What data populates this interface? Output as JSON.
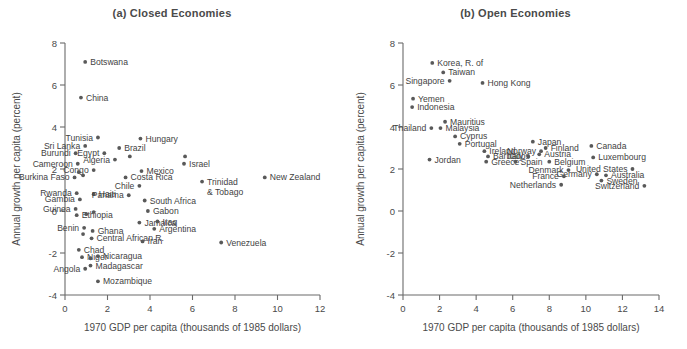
{
  "figure": {
    "width": 687,
    "height": 349,
    "background": "#ffffff",
    "dot_color": "#595959",
    "axis_color": "#6b6b6b",
    "text_color": "#3f3f3f"
  },
  "chart_data": [
    {
      "type": "scatter",
      "panel": "a",
      "title": "(a) Closed Economies",
      "xlabel": "1970 GDP per capita (thousands of 1985 dollars)",
      "ylabel": "Annual growth per capita (percent)",
      "xlim": [
        0,
        12
      ],
      "ylim": [
        -4,
        8
      ],
      "xticks": [
        0,
        2,
        4,
        6,
        8,
        10,
        12
      ],
      "yticks": [
        -4,
        -2,
        0,
        2,
        4,
        6,
        8
      ],
      "grid": false,
      "legend": "none",
      "points": [
        {
          "label": "Botswana",
          "x": 0.95,
          "y": 7.1,
          "lp": "right"
        },
        {
          "label": "China",
          "x": 0.75,
          "y": 5.4,
          "lp": "right"
        },
        {
          "label": "Tunisia",
          "x": 1.55,
          "y": 3.5,
          "lp": "left"
        },
        {
          "label": "Hungary",
          "x": 3.55,
          "y": 3.45,
          "lp": "right"
        },
        {
          "label": "Sri Lanka",
          "x": 0.95,
          "y": 3.1,
          "lp": "left"
        },
        {
          "label": "Brazil",
          "x": 2.55,
          "y": 3.0,
          "lp": "right"
        },
        {
          "label": "",
          "x": 3.05,
          "y": 2.6,
          "lp": "none"
        },
        {
          "label": "Burundi",
          "x": 0.5,
          "y": 2.75,
          "lp": "left"
        },
        {
          "label": "Egypt",
          "x": 1.85,
          "y": 2.75,
          "lp": "left"
        },
        {
          "label": "Algeria",
          "x": 2.35,
          "y": 2.45,
          "lp": "left"
        },
        {
          "label": "Cameroon",
          "x": 0.6,
          "y": 2.25,
          "lp": "left"
        },
        {
          "label": "Israel",
          "x": 5.6,
          "y": 2.25,
          "lp": "right"
        },
        {
          "label": "",
          "x": 5.65,
          "y": 2.6,
          "lp": "none"
        },
        {
          "label": "Congo",
          "x": 1.35,
          "y": 1.95,
          "lp": "left"
        },
        {
          "label": "Mexico",
          "x": 3.6,
          "y": 1.9,
          "lp": "right"
        },
        {
          "label": "",
          "x": 0.65,
          "y": 1.85,
          "lp": "none"
        },
        {
          "label": "",
          "x": 0.85,
          "y": 1.7,
          "lp": "none"
        },
        {
          "label": "Burkina Faso",
          "x": 0.45,
          "y": 1.6,
          "lp": "left"
        },
        {
          "label": "Costa Rica",
          "x": 2.85,
          "y": 1.6,
          "lp": "right"
        },
        {
          "label": "New Zealand",
          "x": 9.4,
          "y": 1.6,
          "lp": "right"
        },
        {
          "label": "Trinidad & Tobago",
          "x": 6.45,
          "y": 1.4,
          "lp": "right"
        },
        {
          "label": "Chile",
          "x": 3.5,
          "y": 1.2,
          "lp": "left"
        },
        {
          "label": "Rwanda",
          "x": 0.55,
          "y": 0.85,
          "lp": "left"
        },
        {
          "label": "Haiti",
          "x": 1.35,
          "y": 0.8,
          "lp": "right"
        },
        {
          "label": "Panama",
          "x": 3.0,
          "y": 0.75,
          "lp": "left"
        },
        {
          "label": "Gambia",
          "x": 0.7,
          "y": 0.55,
          "lp": "left"
        },
        {
          "label": "South Africa",
          "x": 3.75,
          "y": 0.5,
          "lp": "right"
        },
        {
          "label": "Guinea",
          "x": 0.5,
          "y": 0.1,
          "lp": "left"
        },
        {
          "label": "Gabon",
          "x": 3.9,
          "y": 0.0,
          "lp": "right"
        },
        {
          "label": "Ethiopia",
          "x": 0.55,
          "y": -0.2,
          "lp": "right"
        },
        {
          "label": "",
          "x": 1.0,
          "y": -0.15,
          "lp": "none"
        },
        {
          "label": "",
          "x": 1.35,
          "y": -0.05,
          "lp": "none"
        },
        {
          "label": "Jamaica",
          "x": 3.5,
          "y": -0.55,
          "lp": "right"
        },
        {
          "label": "Iraq",
          "x": 4.35,
          "y": -0.5,
          "lp": "right"
        },
        {
          "label": "Benin",
          "x": 0.9,
          "y": -0.8,
          "lp": "left"
        },
        {
          "label": "Argentina",
          "x": 4.2,
          "y": -0.85,
          "lp": "right"
        },
        {
          "label": "Ghana",
          "x": 1.3,
          "y": -0.95,
          "lp": "right"
        },
        {
          "label": "",
          "x": 0.85,
          "y": -1.1,
          "lp": "none"
        },
        {
          "label": "Central African R.",
          "x": 1.25,
          "y": -1.3,
          "lp": "right"
        },
        {
          "label": "Iran",
          "x": 3.65,
          "y": -1.45,
          "lp": "right"
        },
        {
          "label": "Venezuela",
          "x": 7.35,
          "y": -1.5,
          "lp": "right"
        },
        {
          "label": "Chad",
          "x": 0.65,
          "y": -1.85,
          "lp": "right"
        },
        {
          "label": "Niger",
          "x": 0.8,
          "y": -2.2,
          "lp": "right"
        },
        {
          "label": "Nicaragua",
          "x": 1.55,
          "y": -2.15,
          "lp": "right"
        },
        {
          "label": "",
          "x": 1.2,
          "y": -2.25,
          "lp": "none"
        },
        {
          "label": "Madagascar",
          "x": 1.2,
          "y": -2.6,
          "lp": "right"
        },
        {
          "label": "Angola",
          "x": 0.95,
          "y": -2.75,
          "lp": "left"
        },
        {
          "label": "Mozambique",
          "x": 1.55,
          "y": -3.35,
          "lp": "right"
        }
      ]
    },
    {
      "type": "scatter",
      "panel": "b",
      "title": "(b) Open Economies",
      "xlabel": "1970 GDP per capita (thousands of 1985 dollars)",
      "ylabel": "Annual growth per capita (percent)",
      "xlim": [
        0,
        14
      ],
      "ylim": [
        -4,
        8
      ],
      "xticks": [
        0,
        2,
        4,
        6,
        8,
        10,
        12,
        14
      ],
      "yticks": [
        -4,
        -2,
        0,
        2,
        4,
        6,
        8
      ],
      "grid": false,
      "legend": "none",
      "points": [
        {
          "label": "Korea, R. of",
          "x": 1.6,
          "y": 7.05,
          "lp": "right"
        },
        {
          "label": "Taiwan",
          "x": 2.2,
          "y": 6.6,
          "lp": "right"
        },
        {
          "label": "Singapore",
          "x": 2.55,
          "y": 6.2,
          "lp": "left"
        },
        {
          "label": "Hong Kong",
          "x": 4.35,
          "y": 6.1,
          "lp": "right"
        },
        {
          "label": "Yemen",
          "x": 0.55,
          "y": 5.35,
          "lp": "right"
        },
        {
          "label": "Indonesia",
          "x": 0.5,
          "y": 4.95,
          "lp": "right"
        },
        {
          "label": "Mauritius",
          "x": 2.3,
          "y": 4.25,
          "lp": "right"
        },
        {
          "label": "Malaysia",
          "x": 2.05,
          "y": 3.95,
          "lp": "right"
        },
        {
          "label": "Thailand",
          "x": 1.55,
          "y": 3.95,
          "lp": "left"
        },
        {
          "label": "Cyprus",
          "x": 2.85,
          "y": 3.55,
          "lp": "right"
        },
        {
          "label": "Portugal",
          "x": 3.1,
          "y": 3.2,
          "lp": "right"
        },
        {
          "label": "Japan",
          "x": 7.1,
          "y": 3.3,
          "lp": "right"
        },
        {
          "label": "Canada",
          "x": 10.3,
          "y": 3.1,
          "lp": "right"
        },
        {
          "label": "Finland",
          "x": 7.8,
          "y": 3.0,
          "lp": "right"
        },
        {
          "label": "Norway",
          "x": 7.55,
          "y": 2.85,
          "lp": "left"
        },
        {
          "label": "Ireland",
          "x": 4.45,
          "y": 2.85,
          "lp": "right"
        },
        {
          "label": "Austria",
          "x": 7.45,
          "y": 2.7,
          "lp": "right"
        },
        {
          "label": "Luxembourg",
          "x": 10.4,
          "y": 2.55,
          "lp": "right"
        },
        {
          "label": "Barbados",
          "x": 4.65,
          "y": 2.6,
          "lp": "right"
        },
        {
          "label": "Italy",
          "x": 6.85,
          "y": 2.6,
          "lp": "left"
        },
        {
          "label": "Jordan",
          "x": 1.45,
          "y": 2.45,
          "lp": "right"
        },
        {
          "label": "Greece",
          "x": 4.55,
          "y": 2.35,
          "lp": "right"
        },
        {
          "label": "Spain",
          "x": 6.15,
          "y": 2.35,
          "lp": "right"
        },
        {
          "label": "Belgium",
          "x": 8.0,
          "y": 2.35,
          "lp": "right"
        },
        {
          "label": "United States",
          "x": 12.55,
          "y": 2.0,
          "lp": "left"
        },
        {
          "label": "Denmark",
          "x": 9.05,
          "y": 1.95,
          "lp": "left"
        },
        {
          "label": "Germany",
          "x": 10.6,
          "y": 1.75,
          "lp": "left"
        },
        {
          "label": "Australia",
          "x": 11.1,
          "y": 1.7,
          "lp": "right"
        },
        {
          "label": "France",
          "x": 8.8,
          "y": 1.65,
          "lp": "left"
        },
        {
          "label": "Sweden",
          "x": 10.85,
          "y": 1.45,
          "lp": "right"
        },
        {
          "label": "Netherlands",
          "x": 8.65,
          "y": 1.25,
          "lp": "left"
        },
        {
          "label": "Switzerland",
          "x": 13.2,
          "y": 1.2,
          "lp": "left"
        }
      ]
    }
  ]
}
